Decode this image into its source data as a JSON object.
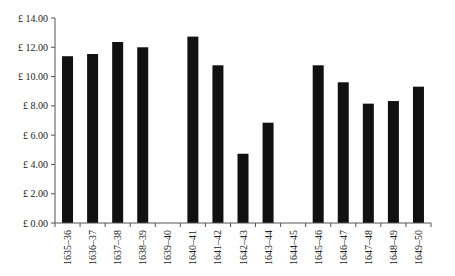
{
  "chart_data": {
    "type": "bar",
    "title": "",
    "xlabel": "",
    "ylabel": "",
    "categories": [
      "1635–36",
      "1636–37",
      "1637–38",
      "1638–39",
      "1639–40",
      "1640–41",
      "1641–42",
      "1642–43",
      "1643–44",
      "1644–45",
      "1645–46",
      "1646–47",
      "1647–48",
      "1648–49",
      "1649–50"
    ],
    "values": [
      11.39,
      11.54,
      12.36,
      12.0,
      null,
      12.73,
      10.77,
      4.73,
      6.85,
      null,
      10.77,
      9.61,
      8.15,
      8.33,
      9.31
    ],
    "ylim": [
      0,
      14
    ],
    "yticks": [
      0,
      2,
      4,
      6,
      8,
      10,
      12,
      14
    ],
    "ytick_labels": [
      "£ 0.00",
      "£ 2.00",
      "£ 4.00",
      "£ 6.00",
      "£ 8.00",
      "£ 10.00",
      "£ 12.00",
      "£ 14.00"
    ],
    "grid": false,
    "legend": null,
    "bar_color": "#111111",
    "x_label_rotation": -90
  }
}
